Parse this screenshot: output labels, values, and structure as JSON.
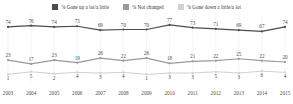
{
  "legend": {
    "items": [
      {
        "label": "% Gone up a lot/a little",
        "color": "#4d4d4d"
      },
      {
        "label": "% Not changed",
        "color": "#9a9a9a"
      },
      {
        "label": "% Gone down a little/a lot",
        "color": "#d0d0d0"
      }
    ]
  },
  "chart_data": {
    "type": "line",
    "title": "",
    "xlabel": "",
    "ylabel": "",
    "ylim": [
      0,
      100
    ],
    "grid": "vertical-dotted",
    "legend_position": "top-center",
    "categories": [
      "2003",
      "2004",
      "2005",
      "2006",
      "2007",
      "2008",
      "2009",
      "2010",
      "2011",
      "2012",
      "2013",
      "2014",
      "2015"
    ],
    "series": [
      {
        "name": "% Gone up a lot/a little",
        "color": "#4d4d4d",
        "values": [
          74,
          76,
          74,
          75,
          69,
          70,
          70,
          77,
          73,
          71,
          69,
          67,
          74
        ]
      },
      {
        "name": "% Not changed",
        "color": "#9a9a9a",
        "values": [
          23,
          17,
          23,
          19,
          26,
          22,
          26,
          18,
          21,
          22,
          25,
          22,
          20
        ]
      },
      {
        "name": "% Gone down a little/a lot",
        "color": "#d0d0d0",
        "values": [
          1,
          5,
          2,
          4,
          3,
          4,
          1,
          3,
          3,
          5,
          3,
          6,
          4
        ]
      }
    ]
  }
}
